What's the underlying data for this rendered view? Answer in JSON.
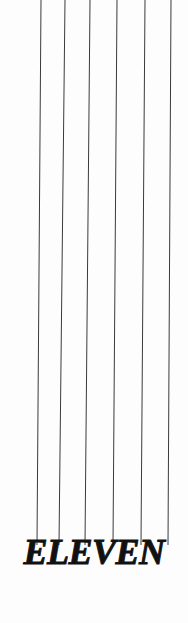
{
  "canvas": {
    "width": 188,
    "height": 623,
    "background_color": "#fdfdfd"
  },
  "wordmark": {
    "text": "ELEVEN",
    "color": "#111111",
    "style": "bold-italic-serif",
    "cap_top_y": 543,
    "baseline_y": 567,
    "left_x": 20,
    "right_x": 178
  },
  "strings": {
    "count": 6,
    "color": "#3a3a3a",
    "stroke_width": 1,
    "top_y": 0,
    "bottom_y": 545,
    "lines": [
      {
        "name": "string-1",
        "x_top": 41,
        "x_bottom": 37
      },
      {
        "name": "string-2",
        "x_top": 65,
        "x_bottom": 59
      },
      {
        "name": "string-3",
        "x_top": 90,
        "x_bottom": 85
      },
      {
        "name": "string-4",
        "x_top": 117,
        "x_bottom": 113
      },
      {
        "name": "string-5",
        "x_top": 145,
        "x_bottom": 141
      },
      {
        "name": "string-6",
        "x_top": 171,
        "x_bottom": 168
      }
    ]
  }
}
